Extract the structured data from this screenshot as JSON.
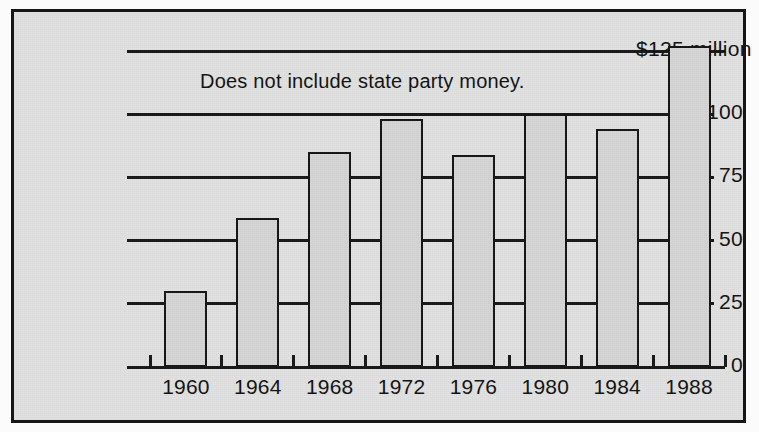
{
  "chart_data": {
    "type": "bar",
    "title": "",
    "subtitle": "",
    "xlabel": "",
    "ylabel": "",
    "categories": [
      "1960",
      "1964",
      "1968",
      "1972",
      "1976",
      "1980",
      "1984",
      "1988"
    ],
    "values": [
      30,
      59,
      85,
      98,
      84,
      100,
      94,
      127
    ],
    "ylim": [
      0,
      135
    ],
    "yticks": [
      0,
      25,
      50,
      75,
      100,
      125
    ],
    "ytick_labels": [
      "0",
      "25",
      "50",
      "75",
      "100",
      "$125 million"
    ],
    "grid": true,
    "legend": null,
    "annotations": [
      {
        "text": "Does not include state party money.",
        "x": 1964,
        "y": 115
      }
    ],
    "units": "millions of dollars",
    "colors": {
      "bar_fill": "#d6d6d6",
      "bar_stroke": "#141414",
      "gridline": "#181818",
      "panel_background": "#e2e2e2",
      "panel_border": "#161616",
      "text": "#111111"
    }
  },
  "annotation_note": "Does not include state party money."
}
